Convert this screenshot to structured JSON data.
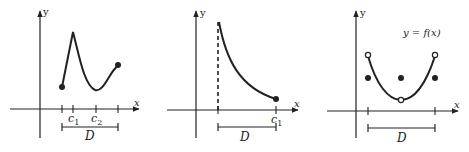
{
  "figure": {
    "panels": [
      {
        "id": "panel-1",
        "axis_labels": {
          "x": "x",
          "y": "y"
        },
        "tick_labels": [
          {
            "main": "c",
            "sub": "1"
          },
          {
            "main": "c",
            "sub": "2"
          }
        ],
        "domain_label": "D",
        "description": "Closed-interval function with a local max (sharp peak) at c1 and local min at c2; both endpoints filled"
      },
      {
        "id": "panel-2",
        "axis_labels": {
          "x": "x",
          "y": "y"
        },
        "tick_labels": [
          {
            "main": "c",
            "sub": "1"
          }
        ],
        "domain_label": "D",
        "description": "Decreasing function with vertical asymptote (dashed) at left end of D; filled right endpoint at c1"
      },
      {
        "id": "panel-3",
        "axis_labels": {
          "x": "x",
          "y": "y"
        },
        "function_label": "y = f(x)",
        "domain_label": "D",
        "description": "Parabola-like curve with open circles at both endpoints and at the vertex; filled points defined separately at the same x-values"
      }
    ]
  },
  "colors": {
    "ink": "#222222",
    "background": "#ffffff"
  }
}
